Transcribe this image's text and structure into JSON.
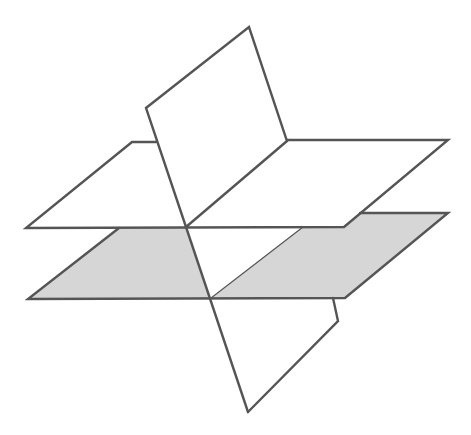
{
  "diagram": {
    "colors": {
      "stroke": "#555555",
      "upper_plane_fill": "#ffffff",
      "lower_plane_fill": "#d6d6d6",
      "background": "#ffffff"
    },
    "shapes": {
      "upper_plane": {
        "label": "",
        "vertices": [
          [
            132,
            142
          ],
          [
            448,
            140
          ],
          [
            344,
            226
          ],
          [
            26,
            228
          ]
        ]
      },
      "lower_plane": {
        "label": "",
        "vertices": [
          [
            119,
            228
          ],
          [
            448,
            213
          ],
          [
            345,
            297
          ],
          [
            28,
            299
          ]
        ]
      },
      "vertical_plane": {
        "label": "",
        "vertices": [
          [
            249,
            27
          ],
          [
            338,
            321
          ],
          [
            248,
            412
          ],
          [
            146,
            108
          ]
        ]
      }
    }
  }
}
